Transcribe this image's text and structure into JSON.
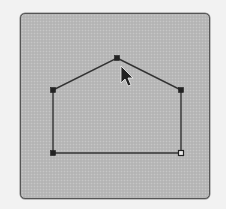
{
  "canvas": {
    "background_color": "#b9b9b9",
    "border_color": "#555555"
  },
  "shape": {
    "type": "polygon",
    "name": "house-outline",
    "stroke_color": "#333333",
    "vertices": [
      {
        "x": 117,
        "y": 58,
        "handle": "filled"
      },
      {
        "x": 181,
        "y": 90,
        "handle": "filled"
      },
      {
        "x": 181,
        "y": 153,
        "handle": "hollow"
      },
      {
        "x": 53,
        "y": 153,
        "handle": "filled"
      },
      {
        "x": 53,
        "y": 90,
        "handle": "filled"
      }
    ]
  },
  "cursor": {
    "icon": "arrow-pointer-icon",
    "x": 121,
    "y": 66
  }
}
